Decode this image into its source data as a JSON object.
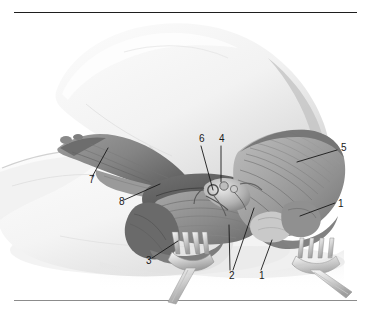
{
  "figure": {
    "kind": "anatomical-illustration",
    "rendering": "grayscale pencil/wash medical illustration",
    "background_color": "#ffffff",
    "ink_color": "#191919",
    "rules": {
      "top_color": "#1e1e1e",
      "bottom_color": "#8c8c8c"
    }
  },
  "labels": [
    {
      "id": "label-1-right",
      "text": "1",
      "x": 338,
      "y": 204
    },
    {
      "id": "label-1-bottom",
      "text": "1",
      "x": 259,
      "y": 276
    },
    {
      "id": "label-2",
      "text": "2",
      "x": 229,
      "y": 276
    },
    {
      "id": "label-3",
      "text": "3",
      "x": 146,
      "y": 261
    },
    {
      "id": "label-4",
      "text": "4",
      "x": 219,
      "y": 139
    },
    {
      "id": "label-5",
      "text": "5",
      "x": 341,
      "y": 148
    },
    {
      "id": "label-6",
      "text": "6",
      "x": 199,
      "y": 139
    },
    {
      "id": "label-7",
      "text": "7",
      "x": 89,
      "y": 180
    },
    {
      "id": "label-8",
      "text": "8",
      "x": 119,
      "y": 202
    }
  ],
  "leaders": [
    {
      "id": "leader-1-right",
      "from": [
        335,
        203
      ],
      "to": [
        300,
        216
      ]
    },
    {
      "id": "leader-1-bottom",
      "from": [
        261,
        270
      ],
      "to": [
        272,
        240
      ]
    },
    {
      "id": "leader-2-a",
      "from": [
        230,
        270
      ],
      "to": [
        229,
        225
      ]
    },
    {
      "id": "leader-2-b",
      "from": [
        233,
        270
      ],
      "to": [
        254,
        208
      ]
    },
    {
      "id": "leader-3",
      "from": [
        152,
        258
      ],
      "to": [
        178,
        241
      ]
    },
    {
      "id": "leader-4",
      "from": [
        221,
        146
      ],
      "to": [
        221,
        182
      ]
    },
    {
      "id": "leader-5",
      "from": [
        337,
        150
      ],
      "to": [
        297,
        162
      ]
    },
    {
      "id": "leader-6",
      "from": [
        201,
        146
      ],
      "to": [
        213,
        190
      ]
    },
    {
      "id": "leader-7",
      "from": [
        92,
        177
      ],
      "to": [
        108,
        148
      ]
    },
    {
      "id": "leader-8",
      "from": [
        124,
        200
      ],
      "to": [
        160,
        184
      ]
    }
  ],
  "structures": [
    {
      "id": "upper-limb",
      "name": "abducted upper limb / arm"
    },
    {
      "id": "thorax",
      "name": "lateral thoracic wall / chest"
    },
    {
      "id": "fan-muscle",
      "name": "fan-shaped muscle with striations (right of field)"
    },
    {
      "id": "axillary-cavity",
      "name": "opened axillary cavity with neurovascular contents"
    },
    {
      "id": "reflected-flap-left",
      "name": "reflected muscle flap (upper left)"
    },
    {
      "id": "retractor-left",
      "name": "four-prong rake retractor, lower left"
    },
    {
      "id": "retractor-right",
      "name": "four-prong rake retractor, lower right"
    }
  ]
}
